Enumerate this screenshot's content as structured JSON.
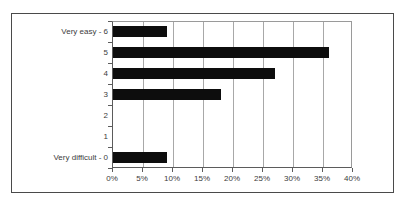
{
  "chart_data": {
    "type": "bar",
    "orientation": "horizontal",
    "title": "",
    "xlabel": "",
    "ylabel": "",
    "categories": [
      "Very difficult - 0",
      "1",
      "2",
      "3",
      "4",
      "5",
      "Very easy - 6"
    ],
    "values": [
      9,
      0,
      0,
      18,
      27,
      36,
      9
    ],
    "xlim": [
      0,
      40
    ],
    "xticks": [
      0,
      5,
      10,
      15,
      20,
      25,
      30,
      35,
      40
    ],
    "xtick_labels": [
      "0%",
      "5%",
      "10%",
      "15%",
      "20%",
      "25%",
      "30%",
      "35%",
      "40%"
    ],
    "value_suffix": "%",
    "grid": "vertical",
    "legend": "none",
    "bar_color": "#0d0d0d",
    "gridline_color": "#a8a8a8",
    "axis_color": "#5b5b5b",
    "frame_color": "#4a4a4a",
    "background_color": "#ffffff",
    "text_color": "#3c3c3c"
  }
}
